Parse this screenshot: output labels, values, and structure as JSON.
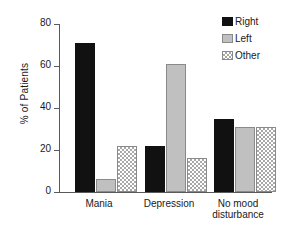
{
  "chart_data": {
    "type": "bar",
    "title": "",
    "subtitle": "",
    "xlabel": "",
    "ylabel": "% of Patients",
    "ylim": [
      0,
      80
    ],
    "yticks": [
      0,
      20,
      40,
      60,
      80
    ],
    "grid": false,
    "legend_position": "top-right",
    "categories": [
      "Mania",
      "Depression",
      "No mood\ndisturbance"
    ],
    "series": [
      {
        "name": "Right",
        "values": [
          71,
          22,
          35
        ],
        "color": "#111111",
        "fill": "solid"
      },
      {
        "name": "Left",
        "values": [
          6,
          61,
          31
        ],
        "color": "#c0c0c0",
        "fill": "solid-light"
      },
      {
        "name": "Other",
        "values": [
          22,
          16,
          31
        ],
        "color": "#a8a8a8",
        "fill": "checkered"
      }
    ]
  },
  "axis": {
    "y": {
      "label": "% of Patients",
      "ticks": [
        "0",
        "20",
        "40",
        "60",
        "80"
      ]
    },
    "x": {
      "labels": [
        "Mania",
        "Depression",
        "No mood\ndisturbance"
      ]
    }
  },
  "legend": {
    "items": [
      {
        "label": "Right",
        "swatch": "black-solid-swatch"
      },
      {
        "label": "Left",
        "swatch": "light-gray-solid-swatch"
      },
      {
        "label": "Other",
        "swatch": "checkered-pattern-swatch"
      }
    ]
  }
}
